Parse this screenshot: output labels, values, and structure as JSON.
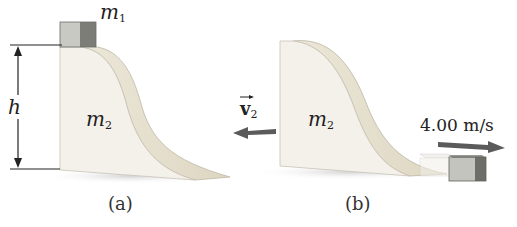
{
  "panels": [
    {
      "id": "a",
      "caption": "(a)",
      "block_label": "m",
      "block_label_sub": "1",
      "ramp_label": "m",
      "ramp_label_sub": "2",
      "height_label": "h"
    },
    {
      "id": "b",
      "caption": "(b)",
      "ramp_label": "m",
      "ramp_label_sub": "2",
      "ramp_velocity_label": "v",
      "ramp_velocity_sub": "2",
      "block_speed_label": "4.00 m/s"
    }
  ],
  "colors": {
    "ramp_face": "#f3f0ea",
    "ramp_curve": "#e6e0cf",
    "ramp_edge": "#b9b2a4",
    "block_light": "#c9c9c3",
    "block_dark": "#7d7d78",
    "arrow": "#5b5b5b",
    "shadow": "#dcdcdc"
  }
}
